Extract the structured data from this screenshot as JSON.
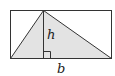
{
  "diagram": {
    "type": "triangle-in-rectangle",
    "labels": {
      "height": "h",
      "base": "b"
    },
    "colors": {
      "stroke": "#333333",
      "triangle_fill": "#e3e3e3",
      "background": "#ffffff"
    },
    "right_angle_marker": true
  }
}
